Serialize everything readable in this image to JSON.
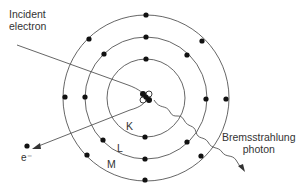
{
  "diagram": {
    "type": "bremsstrahlung-atom-diagram",
    "labels": {
      "incident_line1": "Incident",
      "incident_line2": "electron",
      "photon_line1": "Bremsstrahlung",
      "photon_line2": "photon",
      "electron_out": "e⁻"
    },
    "shells": [
      {
        "name": "K",
        "radius": 39
      },
      {
        "name": "L",
        "radius": 61
      },
      {
        "name": "M",
        "radius": 83
      }
    ],
    "colors": {
      "line": "#555555",
      "dot": "#111111",
      "text": "#333333"
    }
  }
}
